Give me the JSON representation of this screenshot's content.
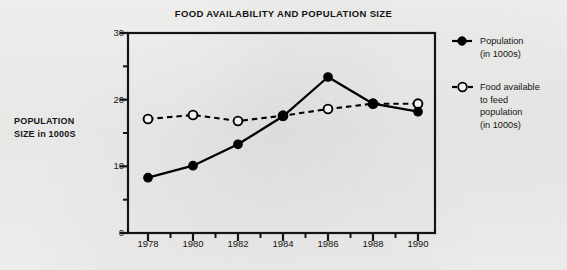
{
  "chart_data": {
    "type": "line",
    "title": "FOOD AVAILABILITY AND POPULATION SIZE",
    "xlabel": "",
    "ylabel": "POPULATION SIZE in 1000S",
    "ylabel_line1": "POPULATION",
    "ylabel_line2": "SIZE in 1000S",
    "x": [
      1978,
      1980,
      1982,
      1984,
      1986,
      1988,
      1990
    ],
    "categories": [
      "1978",
      "1980",
      "1982",
      "1984",
      "1986",
      "1988",
      "1990"
    ],
    "series": [
      {
        "name": "Population (in 1000s)",
        "marker": "filled-circle",
        "line": "solid",
        "color": "#000000",
        "values": [
          8.3,
          10.1,
          13.3,
          17.5,
          23.4,
          19.4,
          18.2
        ]
      },
      {
        "name": "Food available to feed population (in 1000s)",
        "marker": "open-circle",
        "line": "dashed",
        "color": "#000000",
        "values": [
          17.1,
          17.7,
          16.8,
          17.6,
          18.6,
          19.4,
          19.4
        ]
      }
    ],
    "ylim": [
      0,
      30
    ],
    "yticks": [
      0,
      10,
      20,
      30
    ],
    "yticks_minor": [
      5,
      15,
      25
    ],
    "xticks": [
      1978,
      1980,
      1982,
      1984,
      1986,
      1988,
      1990
    ],
    "xticks_minor": [
      1979,
      1981,
      1983,
      1985,
      1987,
      1989
    ],
    "grid": false,
    "legend_position": "right"
  },
  "axes": {
    "y_tick_labels": [
      "30",
      "20",
      "10",
      "0"
    ],
    "x_tick_labels": [
      "1978",
      "1980",
      "1982",
      "1984",
      "1986",
      "1988",
      "1990"
    ]
  },
  "legend": {
    "items": [
      {
        "marker": "filled-circle",
        "line_style": "solid",
        "label_lines": [
          "Population",
          "(in 1000s)"
        ]
      },
      {
        "marker": "open-circle",
        "line_style": "dashed",
        "label_lines": [
          "Food available",
          "to feed",
          "population",
          "(in 1000s)"
        ]
      }
    ]
  },
  "colors": {
    "ink": "#141414",
    "paper": "#f2f2f0",
    "series_population": "#000000",
    "series_food": "#000000"
  }
}
